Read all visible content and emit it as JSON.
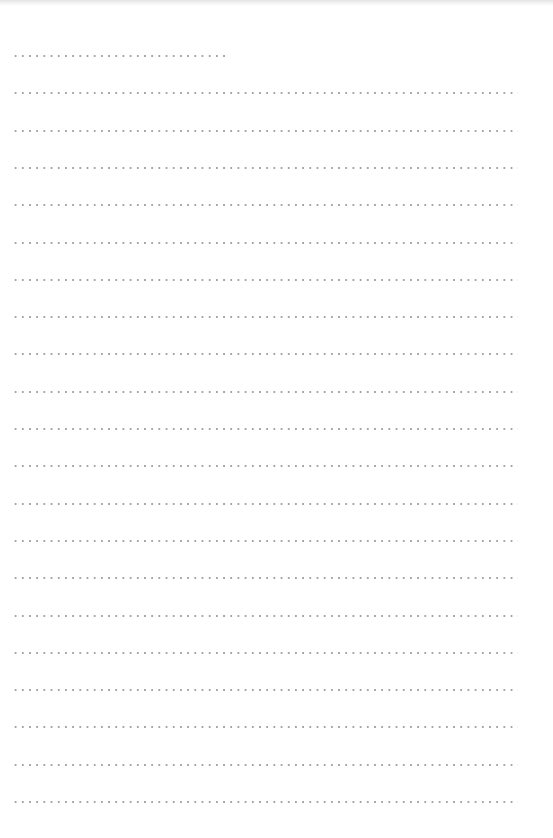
{
  "page": {
    "type": "dotted-lined-writing-sheet",
    "background_color": "#ffffff",
    "dot_color": "#a4a4a4"
  },
  "lines": {
    "count": 21,
    "first_y": 55,
    "spacing": 37.3,
    "left_x": 12,
    "full_width": 506,
    "first_line_width": 218,
    "content": [
      "",
      "",
      "",
      "",
      "",
      "",
      "",
      "",
      "",
      "",
      "",
      "",
      "",
      "",
      "",
      "",
      "",
      "",
      "",
      "",
      ""
    ]
  }
}
